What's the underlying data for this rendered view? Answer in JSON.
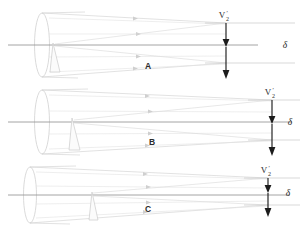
{
  "figure": {
    "type": "optical-ray-diagram",
    "background_color": "#ffffff",
    "width": 303,
    "height": 232,
    "ray_color": "#d8d8d8",
    "axis_color": "#9a9a9a",
    "arrow_color": "#1c1c1c",
    "panel_count": 3
  },
  "panels": [
    {
      "id": "panel-a",
      "label": "A",
      "label_x": 148,
      "label_y": 69,
      "axis_y": 45,
      "aperture": {
        "cx": 42,
        "cy": 45,
        "rx": 7.5,
        "ry": 32
      },
      "wedge": {
        "x_top": 53,
        "y_top": 43,
        "x_bot_left": 50,
        "x_bot_right": 60,
        "y_bot": 72
      },
      "cone_top_start_y": 13,
      "cone_bot_start_y": 77,
      "converge_x": 226,
      "converge_top_y": 23,
      "converge_bot_y": 63,
      "vlabel_x": 226,
      "vlabel_y": 17,
      "plane_top_y": 23,
      "plane_bot_y": 63,
      "arrow_x": 226,
      "arrow1_y1": 23,
      "arrow1_y2": 46,
      "arrow2_y1": 46,
      "arrow2_y2": 78,
      "delta_x": 285,
      "delta_y": 48
    },
    {
      "id": "panel-b",
      "label": "B",
      "label_x": 152,
      "label_y": 145,
      "axis_y": 122,
      "aperture": {
        "cx": 42,
        "cy": 122,
        "rx": 7.5,
        "ry": 32
      },
      "wedge": {
        "x_top": 72,
        "y_top": 118,
        "x_bot_left": 69,
        "x_bot_right": 80,
        "y_bot": 150
      },
      "cone_top_start_y": 90,
      "cone_bot_start_y": 154,
      "converge_x": 272,
      "converge_top_y": 100,
      "converge_bot_y": 140,
      "vlabel_x": 272,
      "vlabel_y": 94,
      "plane_top_y": 100,
      "plane_bot_y": 140,
      "arrow_x": 272,
      "arrow1_y1": 100,
      "arrow1_y2": 123,
      "arrow2_y1": 123,
      "arrow2_y2": 155,
      "delta_x": 290,
      "delta_y": 125
    },
    {
      "id": "panel-c",
      "label": "C",
      "label_x": 148,
      "label_y": 212,
      "axis_y": 195,
      "aperture": {
        "cx": 30,
        "cy": 195,
        "rx": 6.5,
        "ry": 28
      },
      "wedge": {
        "x_top": 92,
        "y_top": 192,
        "x_bot_left": 89,
        "x_bot_right": 98,
        "y_bot": 220
      },
      "cone_top_start_y": 167,
      "cone_bot_start_y": 223,
      "converge_x": 268,
      "converge_top_y": 178,
      "converge_bot_y": 205,
      "vlabel_x": 268,
      "vlabel_y": 172,
      "plane_top_y": 178,
      "plane_bot_y": 205,
      "arrow_x": 268,
      "arrow1_y1": 178,
      "arrow1_y2": 192,
      "arrow2_y1": 192,
      "arrow2_y2": 216,
      "delta_x": 288,
      "delta_y": 196
    }
  ],
  "labels": {
    "v_symbol": "V",
    "v_subscript": "2",
    "v_prime": "′",
    "delta_symbol": "δ",
    "panel_a": "A",
    "panel_b": "B",
    "panel_c": "C"
  }
}
